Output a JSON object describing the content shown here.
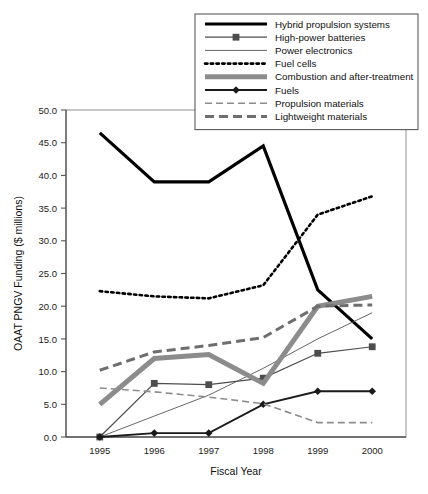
{
  "chart_data": {
    "type": "line",
    "title": "",
    "xlabel": "Fiscal Year",
    "ylabel": "OAAT PNGV Funding ($ millions)",
    "categories": [
      "1995",
      "1996",
      "1997",
      "1998",
      "1999",
      "2000"
    ],
    "x": [
      1995,
      1996,
      1997,
      1998,
      1999,
      2000
    ],
    "xlim": [
      1994.7,
      2000.5
    ],
    "ylim": [
      0.0,
      50.0
    ],
    "yticks": [
      "0.0",
      "5.0",
      "10.0",
      "15.0",
      "20.0",
      "25.0",
      "30.0",
      "35.0",
      "40.0",
      "45.0",
      "50.0"
    ],
    "ytick_values": [
      0,
      5,
      10,
      15,
      20,
      25,
      30,
      35,
      40,
      45,
      50
    ],
    "grid": false,
    "legend_position": "top-right",
    "series": [
      {
        "name": "Hybrid propulsion systems",
        "style": "solid-thick",
        "color": "#000000",
        "width": 3.2,
        "marker": "none",
        "values": [
          46.5,
          39.0,
          39.0,
          44.5,
          22.5,
          15.0
        ]
      },
      {
        "name": "High-power batteries",
        "style": "solid-thin",
        "color": "#4d4d4d",
        "width": 1.2,
        "marker": "square",
        "values": [
          0.0,
          8.2,
          8.0,
          9.0,
          12.8,
          13.8
        ]
      },
      {
        "name": "Power electronics",
        "style": "solid-hairline",
        "color": "#555555",
        "width": 0.9,
        "marker": "none",
        "values": [
          0.0,
          3.2,
          6.4,
          10.5,
          15.0,
          19.0
        ]
      },
      {
        "name": "Fuel cells",
        "style": "dotted",
        "color": "#000000",
        "width": 2.6,
        "marker": "none",
        "values": [
          22.3,
          21.5,
          21.2,
          23.2,
          34.0,
          36.8
        ]
      },
      {
        "name": "Combustion and after-treatment",
        "style": "solid-verythick",
        "color": "#8c8c8c",
        "width": 5.0,
        "marker": "none",
        "values": [
          5.0,
          12.0,
          12.6,
          8.2,
          20.0,
          21.5
        ]
      },
      {
        "name": "Fuels",
        "style": "solid-medium",
        "color": "#1a1a1a",
        "width": 1.9,
        "marker": "diamond",
        "values": [
          0.0,
          0.6,
          0.6,
          5.0,
          7.0,
          7.0
        ]
      },
      {
        "name": "Propulsion materials",
        "style": "dashed-thin",
        "color": "#8c8c8c",
        "width": 1.6,
        "marker": "none",
        "values": [
          7.5,
          6.9,
          6.1,
          5.1,
          2.2,
          2.2
        ]
      },
      {
        "name": "Lightweight materials",
        "style": "dashed-thick",
        "color": "#6e6e6e",
        "width": 3.0,
        "marker": "none",
        "values": [
          10.2,
          13.0,
          14.0,
          15.2,
          20.0,
          20.2
        ]
      }
    ]
  }
}
